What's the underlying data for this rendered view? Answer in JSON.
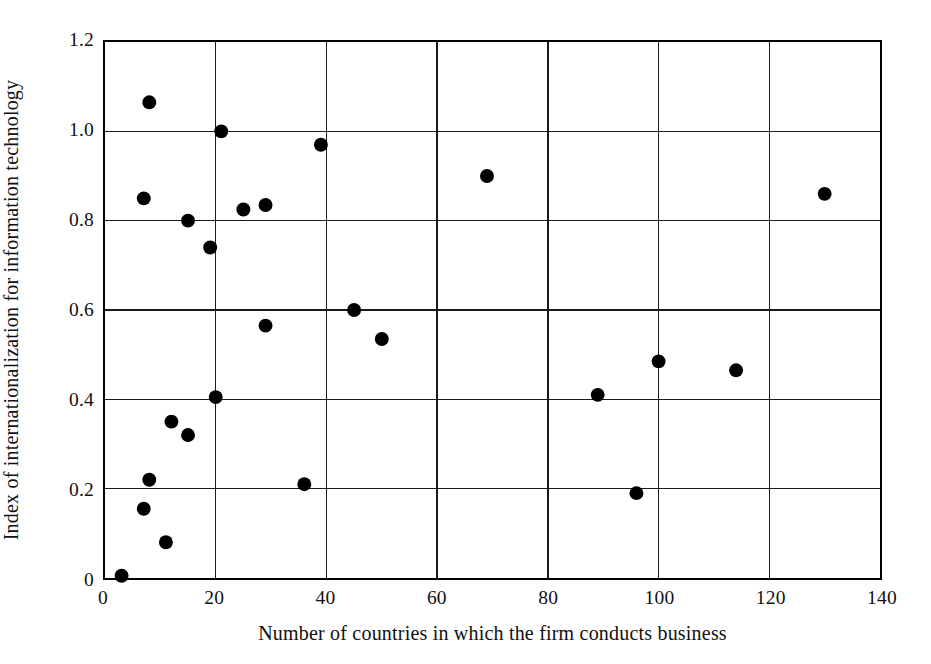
{
  "chart_data": {
    "type": "scatter",
    "title": "",
    "xlabel": "Number of countries in which the firm conducts business",
    "ylabel": "Index of internationalization for information technology",
    "xlim": [
      0,
      140
    ],
    "ylim": [
      0,
      1.2
    ],
    "xticks": [
      0,
      20,
      40,
      60,
      80,
      100,
      120,
      140
    ],
    "xtick_labels": [
      "0",
      "20",
      "40",
      "60",
      "80",
      "100",
      "120",
      "140"
    ],
    "yticks": [
      0,
      0.2,
      0.4,
      0.6,
      0.8,
      1.0,
      1.2
    ],
    "ytick_labels": [
      "0",
      "0.2",
      "0.4",
      "0.6",
      "0.8",
      "1.0",
      "1.2"
    ],
    "grid": true,
    "grid_axes": "both",
    "legend": false,
    "marker": "filled-circle",
    "marker_color": "#000000",
    "marker_size_px": 7,
    "points": [
      {
        "x": 3,
        "y": 0.005
      },
      {
        "x": 8,
        "y": 1.065
      },
      {
        "x": 7,
        "y": 0.85
      },
      {
        "x": 15,
        "y": 0.8
      },
      {
        "x": 19,
        "y": 0.74
      },
      {
        "x": 21,
        "y": 1.0
      },
      {
        "x": 25,
        "y": 0.825
      },
      {
        "x": 29,
        "y": 0.835
      },
      {
        "x": 39,
        "y": 0.97
      },
      {
        "x": 69,
        "y": 0.9
      },
      {
        "x": 130,
        "y": 0.86
      },
      {
        "x": 45,
        "y": 0.6
      },
      {
        "x": 50,
        "y": 0.535
      },
      {
        "x": 29,
        "y": 0.565
      },
      {
        "x": 20,
        "y": 0.405
      },
      {
        "x": 12,
        "y": 0.35
      },
      {
        "x": 15,
        "y": 0.32
      },
      {
        "x": 8,
        "y": 0.22
      },
      {
        "x": 7,
        "y": 0.155
      },
      {
        "x": 11,
        "y": 0.08
      },
      {
        "x": 36,
        "y": 0.21
      },
      {
        "x": 89,
        "y": 0.41
      },
      {
        "x": 96,
        "y": 0.19
      },
      {
        "x": 100,
        "y": 0.485
      },
      {
        "x": 114,
        "y": 0.465
      }
    ]
  }
}
